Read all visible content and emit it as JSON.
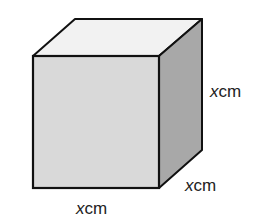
{
  "diagram": {
    "shape": "cube",
    "labels": {
      "height": {
        "var": "x",
        "unit": "cm"
      },
      "depth": {
        "var": "x",
        "unit": "cm"
      },
      "width": {
        "var": "x",
        "unit": "cm"
      }
    },
    "colors": {
      "front": "#d9d9d9",
      "top": "#f2f2f2",
      "side": "#a8a8a8",
      "edge": "#111111"
    }
  }
}
